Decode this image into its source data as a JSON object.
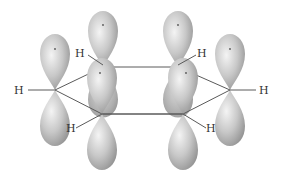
{
  "diagram": {
    "colors": {
      "background": "#ffffff",
      "lobe_light": "#f2f2f2",
      "lobe_mid": "#bdbdbd",
      "lobe_dark": "#8a8a8a",
      "bond": "#5a5a5a",
      "label": "#333333"
    },
    "atoms": [
      {
        "id": "C1",
        "position": "left",
        "x": 55,
        "y": 90
      },
      {
        "id": "C2",
        "position": "back-left",
        "x": 103,
        "y": 67
      },
      {
        "id": "C3",
        "position": "back-right",
        "x": 178,
        "y": 67
      },
      {
        "id": "C4",
        "position": "right",
        "x": 230,
        "y": 90
      },
      {
        "id": "C5",
        "position": "front-right",
        "x": 183,
        "y": 114
      },
      {
        "id": "C6",
        "position": "front-left",
        "x": 102,
        "y": 114
      }
    ],
    "hydrogens": [
      {
        "label": "H",
        "attached_to": "C1",
        "x": 18,
        "y": 94
      },
      {
        "label": "H",
        "attached_to": "C2",
        "x": 79,
        "y": 57
      },
      {
        "label": "H",
        "attached_to": "C3",
        "x": 199,
        "y": 57
      },
      {
        "label": "H",
        "attached_to": "C4",
        "x": 259,
        "y": 94
      },
      {
        "label": "H",
        "attached_to": "C5",
        "x": 209,
        "y": 131
      },
      {
        "label": "H",
        "attached_to": "C6",
        "x": 66,
        "y": 131
      }
    ],
    "orbital_lobes_per_carbon": 2,
    "labels": [
      "H",
      "H",
      "H",
      "H",
      "H",
      "H"
    ]
  }
}
